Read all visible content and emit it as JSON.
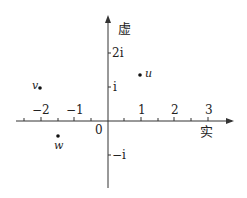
{
  "diagram": {
    "axes": {
      "real_label": "实",
      "imag_label": "虚",
      "origin_label": "0",
      "real_ticks": [
        "−2",
        "−1",
        "1",
        "2",
        "3"
      ],
      "imag_ticks": [
        "2i",
        "i",
        "−i"
      ]
    },
    "points": [
      {
        "name": "u",
        "re": 1,
        "im": 1.35
      },
      {
        "name": "v",
        "re": -2,
        "im": 1
      },
      {
        "name": "w",
        "re": -1.5,
        "im": -0.45
      }
    ],
    "colors": {
      "ink": "#222222",
      "background": "#ffffff"
    }
  }
}
